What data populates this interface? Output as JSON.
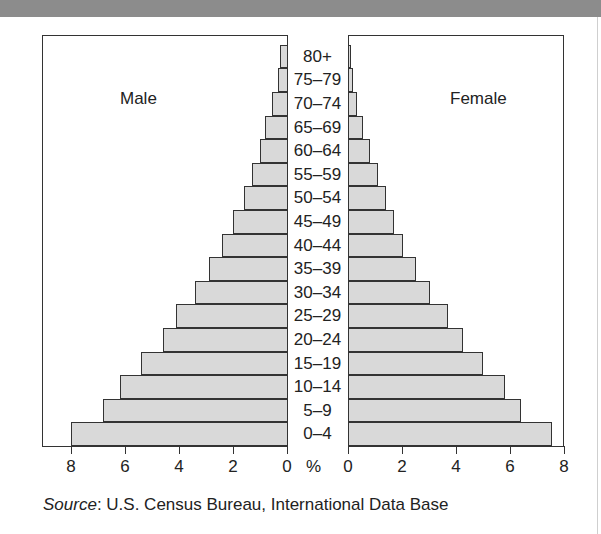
{
  "chart_data": {
    "type": "bar",
    "subtype": "population-pyramid",
    "title": "",
    "categories": [
      "0–4",
      "5–9",
      "10–14",
      "15–19",
      "20–24",
      "25–29",
      "30–34",
      "35–39",
      "40–44",
      "45–49",
      "50–54",
      "55–59",
      "60–64",
      "65–69",
      "70–74",
      "75–79",
      "80+"
    ],
    "series": [
      {
        "name": "Male",
        "values": [
          8.0,
          6.8,
          6.2,
          5.4,
          4.6,
          4.1,
          3.4,
          2.9,
          2.4,
          2.0,
          1.6,
          1.3,
          1.0,
          0.8,
          0.55,
          0.35,
          0.25
        ]
      },
      {
        "name": "Female",
        "values": [
          7.55,
          6.4,
          5.8,
          5.0,
          4.25,
          3.7,
          3.05,
          2.5,
          2.05,
          1.7,
          1.4,
          1.1,
          0.8,
          0.55,
          0.35,
          0.2,
          0.1
        ]
      }
    ],
    "xlabel": "%",
    "ylabel": "",
    "xlim": [
      0,
      8
    ],
    "x_ticks": [
      0,
      2,
      4,
      6,
      8
    ],
    "grid": false,
    "legend": "none",
    "annotations": [
      "Male",
      "Female"
    ],
    "source": "Source: U.S. Census Bureau, International Data Base"
  },
  "labels": {
    "male": "Male",
    "female": "Female",
    "percent": "%",
    "source_prefix": "Source",
    "source_text": ": U.S. Census Bureau, International Data Base"
  },
  "axis": {
    "male_ticks": [
      "8",
      "6",
      "4",
      "2",
      "0"
    ],
    "female_ticks": [
      "0",
      "2",
      "4",
      "6",
      "8"
    ]
  },
  "colors": {
    "bar_fill": "#d9d9d9",
    "bar_stroke": "#333333",
    "header_band": "#8c8c8c"
  }
}
